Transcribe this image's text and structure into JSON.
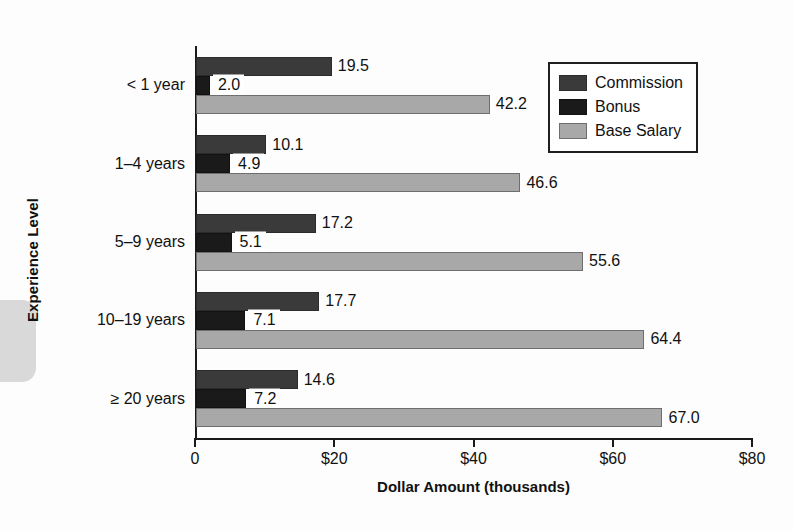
{
  "chart_data": {
    "type": "bar",
    "orientation": "horizontal",
    "title": "",
    "xlabel": "Dollar Amount (thousands)",
    "ylabel": "Experience Level",
    "xlim": [
      0,
      80
    ],
    "xticks": [
      0,
      20,
      40,
      60,
      80
    ],
    "xtick_labels": [
      "0",
      "$20",
      "$40",
      "$60",
      "$80"
    ],
    "grid": false,
    "legend_position": "top-right",
    "categories": [
      "< 1 year",
      "1–4 years",
      "5–9 years",
      "10–19 years",
      "≥ 20 years"
    ],
    "series": [
      {
        "name": "Commission",
        "color": "#3a3a3a",
        "values": [
          19.5,
          10.1,
          17.2,
          17.7,
          14.6
        ],
        "labels": [
          "19.5",
          "10.1",
          "17.2",
          "17.7",
          "14.6"
        ]
      },
      {
        "name": "Bonus",
        "color": "#1a1a1a",
        "values": [
          2.0,
          4.9,
          5.1,
          7.1,
          7.2
        ],
        "labels": [
          "2.0",
          "4.9",
          "5.1",
          "7.1",
          "7.2"
        ]
      },
      {
        "name": "Base Salary",
        "color": "#a8a8a8",
        "values": [
          42.2,
          46.6,
          55.6,
          64.4,
          67.0
        ],
        "labels": [
          "42.2",
          "46.6",
          "55.6",
          "64.4",
          "67.0"
        ]
      }
    ]
  },
  "legend": {
    "items": [
      {
        "label": "Commission",
        "color": "#3a3a3a"
      },
      {
        "label": "Bonus",
        "color": "#1a1a1a"
      },
      {
        "label": "Base Salary",
        "color": "#a8a8a8"
      }
    ]
  },
  "axes": {
    "x_title": "Dollar Amount (thousands)",
    "y_title": "Experience Level"
  }
}
